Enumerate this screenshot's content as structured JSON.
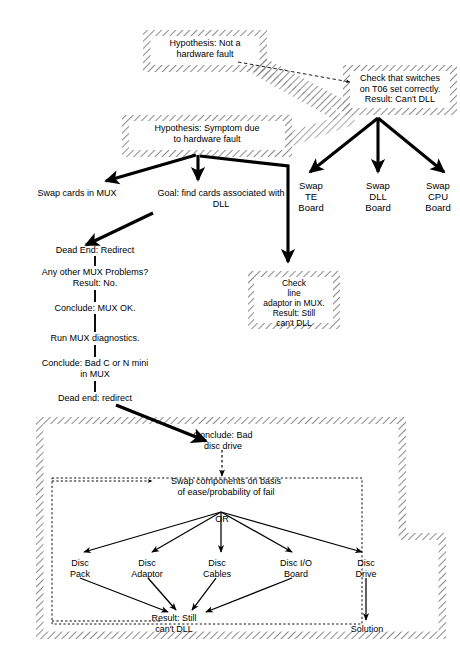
{
  "diagram": {
    "type": "flow-diagram",
    "colors": {
      "ink": "#000000",
      "background": "#ffffff",
      "hatch": "#9a9a9a",
      "dashed": "#111111"
    },
    "hatched_boxes": [
      {
        "id": "hypothesis-not-hardware",
        "label": "Hypothesis:  Not a\nhardware fault",
        "line1": "Hypothesis:  Not a",
        "line2": "hardware fault",
        "x": 143,
        "y": 30,
        "w": 124,
        "h": 42
      },
      {
        "id": "check-switches-t06",
        "label": "Check that switches\non T06 set correctly.\nResult:  Can't DLL",
        "line1": "Check that switches",
        "line2": "on T06 set correctly.",
        "line3": "Result:  Can't DLL",
        "x": 343,
        "y": 65,
        "w": 114,
        "h": 50
      },
      {
        "id": "hypothesis-symptom-hardware",
        "label": "Hypothesis:  Symptom due\nto hardware fault",
        "line1": "Hypothesis:  Symptom due",
        "line2": "to hardware fault",
        "x": 122,
        "y": 115,
        "w": 170,
        "h": 42
      },
      {
        "id": "check-line-adaptor",
        "label": "Check\nline\nadaptor in MUX.\nResult: Still\ncan't DLL",
        "line1": "Check",
        "line2": "line",
        "line3": "adaptor in MUX.",
        "line4": "Result: Still",
        "line5": "can't DLL",
        "x": 248,
        "y": 271,
        "w": 92,
        "h": 58
      }
    ],
    "outer_box": {
      "id": "disc-subsystem-region",
      "x": 36,
      "y": 417,
      "w": 370,
      "h": 222
    },
    "outer_box_ext": {
      "id": "disc-subsystem-region-extension",
      "x": 328,
      "y": 533,
      "w": 118,
      "h": 106
    },
    "inner_dashed_box": {
      "id": "swap-components-region",
      "x": 52,
      "y": 478,
      "w": 310,
      "h": 146
    },
    "nodes": [
      {
        "id": "swap-cards-in-mux",
        "text": "Swap cards in MUX",
        "x": 30,
        "y": 192,
        "align": "left"
      },
      {
        "id": "goal-find-cards",
        "line1": "Goal: find cards associated with",
        "line2": "DLL",
        "x": 131,
        "y": 192
      },
      {
        "id": "swap-te-board",
        "line1": "Swap",
        "line2": "TE",
        "line3": "Board",
        "x": 305,
        "y": 186
      },
      {
        "id": "swap-dll-board",
        "line1": "Swap",
        "line2": "DLL",
        "line3": "Board",
        "x": 360,
        "y": 186
      },
      {
        "id": "swap-cpu-board",
        "line1": "Swap",
        "line2": "CPU",
        "line3": "Board",
        "x": 415,
        "y": 186
      },
      {
        "id": "dead-end-redirect-1",
        "text": "Dead End: Redirect",
        "x": 95,
        "y": 249
      },
      {
        "id": "any-other-mux-problems",
        "line1": "Any other MUX Problems?",
        "line2": "Result: No.",
        "x": 95,
        "y": 272
      },
      {
        "id": "conclude-mux-ok",
        "text": "Conclude: MUX OK.",
        "x": 95,
        "y": 307
      },
      {
        "id": "run-mux-diagnostics",
        "text": "Run MUX diagnostics.",
        "x": 95,
        "y": 338
      },
      {
        "id": "conclude-bad-c-or-n-mini",
        "line1": "Conclude:  Bad C or N mini",
        "line2": "in MUX",
        "x": 95,
        "y": 363
      },
      {
        "id": "dead-end-redirect-2",
        "text": "Dead end: redirect",
        "x": 95,
        "y": 398
      },
      {
        "id": "conclude-bad-disc-drive",
        "line1": "Conclude: Bad",
        "line2": "disc drive",
        "x": 222,
        "y": 434
      },
      {
        "id": "swap-components",
        "line1": "Swap components on basis",
        "line2": "of ease/probability of fail",
        "x": 225,
        "y": 481
      },
      {
        "id": "or-connector",
        "text": "OR",
        "x": 222,
        "y": 518
      },
      {
        "id": "disc-pack",
        "line1": "Disc",
        "line2": "Pack",
        "x": 78,
        "y": 562
      },
      {
        "line1": "Disc",
        "line2": "Adaptor",
        "id": "disc-adaptor",
        "x": 146,
        "y": 562
      },
      {
        "id": "disc-cables",
        "line1": "Disc",
        "line2": "Cables",
        "x": 217,
        "y": 562
      },
      {
        "id": "disc-io-board",
        "line1": "Disc I/O",
        "line2": "Board",
        "x": 296,
        "y": 562
      },
      {
        "id": "disc-drive",
        "line1": "Disc",
        "line2": "Drive",
        "x": 366,
        "y": 562
      },
      {
        "id": "result-still-cant-dll",
        "line1": "Result: Still",
        "line2": "can't DLL",
        "x": 172,
        "y": 619
      },
      {
        "id": "solution",
        "text": "Solution",
        "x": 366,
        "y": 628
      }
    ],
    "edges": [
      {
        "from": "hypothesis-not-hardware",
        "to": "check-switches-t06",
        "style": "dashed-thin-arrow"
      },
      {
        "from": "check-switches-t06",
        "to": "swap-te-board",
        "style": "thick-arrow"
      },
      {
        "from": "check-switches-t06",
        "to": "swap-dll-board",
        "style": "thick-arrow"
      },
      {
        "from": "check-switches-t06",
        "to": "swap-cpu-board",
        "style": "thick-arrow"
      },
      {
        "from": "hypothesis-symptom-hardware",
        "to": "swap-cards-in-mux",
        "style": "thick-arrow"
      },
      {
        "from": "hypothesis-symptom-hardware",
        "to": "goal-find-cards",
        "style": "thick-arrow"
      },
      {
        "from": "hypothesis-symptom-hardware",
        "to": "check-line-adaptor",
        "style": "thick-arrow"
      },
      {
        "from": "goal-find-cards",
        "to": "dead-end-redirect-1",
        "style": "thick-arrow"
      },
      {
        "from": "dead-end-redirect-1",
        "to": "any-other-mux-problems",
        "style": "thin-line"
      },
      {
        "from": "any-other-mux-problems",
        "to": "conclude-mux-ok",
        "style": "thin-line"
      },
      {
        "from": "conclude-mux-ok",
        "to": "run-mux-diagnostics",
        "style": "thin-line"
      },
      {
        "from": "run-mux-diagnostics",
        "to": "conclude-bad-c-or-n-mini",
        "style": "thin-line"
      },
      {
        "from": "conclude-bad-c-or-n-mini",
        "to": "dead-end-redirect-2",
        "style": "thin-line"
      },
      {
        "from": "dead-end-redirect-2",
        "to": "conclude-bad-disc-drive",
        "style": "thick-arrow"
      },
      {
        "from": "conclude-bad-disc-drive",
        "to": "swap-components",
        "style": "dashed-arrow"
      },
      {
        "from": "swap-components",
        "to": "disc-pack",
        "style": "thin-arrow"
      },
      {
        "from": "swap-components",
        "to": "disc-adaptor",
        "style": "thin-arrow"
      },
      {
        "from": "swap-components",
        "to": "disc-cables",
        "style": "thin-arrow"
      },
      {
        "from": "swap-components",
        "to": "disc-io-board",
        "style": "thin-arrow"
      },
      {
        "from": "swap-components",
        "to": "disc-drive",
        "style": "thin-arrow"
      },
      {
        "from": "disc-pack",
        "to": "result-still-cant-dll",
        "style": "thin-arrow"
      },
      {
        "from": "disc-adaptor",
        "to": "result-still-cant-dll",
        "style": "thin-arrow"
      },
      {
        "from": "disc-cables",
        "to": "result-still-cant-dll",
        "style": "thin-arrow"
      },
      {
        "from": "disc-io-board",
        "to": "result-still-cant-dll",
        "style": "thin-arrow"
      },
      {
        "from": "disc-drive",
        "to": "solution",
        "style": "thin-arrow"
      }
    ]
  }
}
